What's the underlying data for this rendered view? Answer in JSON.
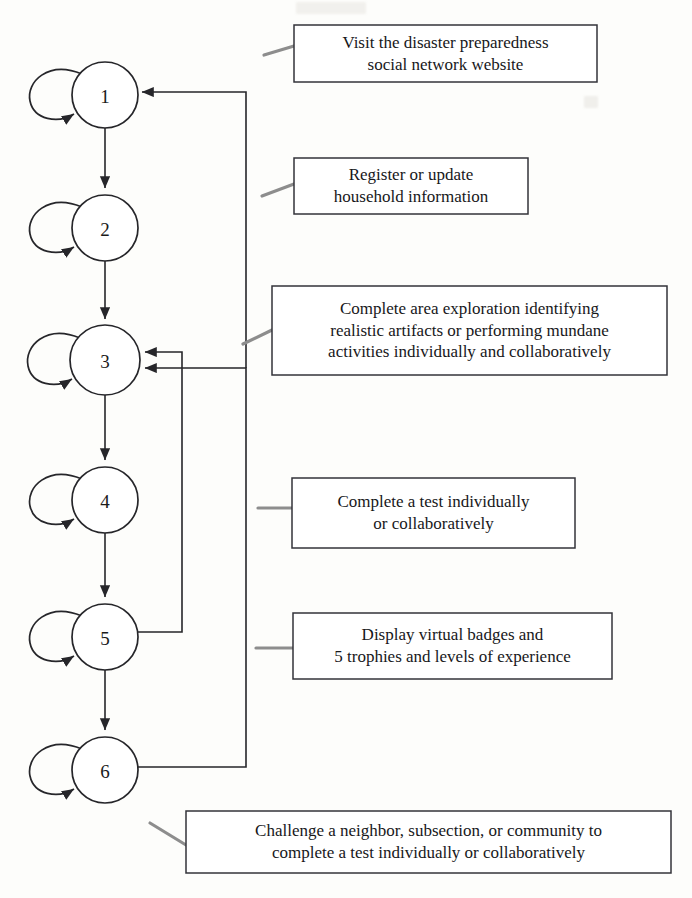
{
  "diagram": {
    "type": "flowchart-state-diagram",
    "background_color": "#fdfdfb",
    "stroke_color": "#26262a",
    "leader_color": "#8d8d8d",
    "nodes": [
      {
        "id": "node-1",
        "label": "1",
        "cx": 105,
        "cy": 95,
        "r": 33
      },
      {
        "id": "node-2",
        "label": "2",
        "cx": 105,
        "cy": 228,
        "r": 33
      },
      {
        "id": "node-3",
        "label": "3",
        "cx": 105,
        "cy": 360,
        "r": 35
      },
      {
        "id": "node-4",
        "label": "4",
        "cx": 105,
        "cy": 500,
        "r": 33
      },
      {
        "id": "node-5",
        "label": "5",
        "cx": 105,
        "cy": 637,
        "r": 33
      },
      {
        "id": "node-6",
        "label": "6",
        "cx": 105,
        "cy": 770,
        "r": 33
      }
    ],
    "callouts": [
      {
        "id": "callout-1",
        "for_node": "1",
        "lines": [
          "Visit the disaster preparedness",
          "social network website"
        ],
        "x": 294,
        "y": 25,
        "w": 303,
        "h": 57,
        "font_size": 17
      },
      {
        "id": "callout-2",
        "for_node": "2",
        "lines": [
          "Register or update",
          "household information"
        ],
        "x": 294,
        "y": 158,
        "w": 234,
        "h": 56,
        "font_size": 17
      },
      {
        "id": "callout-3",
        "for_node": "3",
        "lines": [
          "Complete area exploration identifying",
          "realistic artifacts or performing mundane",
          "activities individually and collaboratively"
        ],
        "x": 272,
        "y": 286,
        "w": 395,
        "h": 89,
        "font_size": 17
      },
      {
        "id": "callout-4",
        "for_node": "4",
        "lines": [
          "Complete a test individually",
          "or collaboratively"
        ],
        "x": 292,
        "y": 478,
        "w": 283,
        "h": 70,
        "font_size": 17
      },
      {
        "id": "callout-5",
        "for_node": "5",
        "lines": [
          "Display virtual badges and",
          "5 trophies and levels of experience"
        ],
        "x": 293,
        "y": 613,
        "w": 319,
        "h": 66,
        "font_size": 17
      },
      {
        "id": "callout-6",
        "for_node": "6",
        "lines": [
          "Challenge a neighbor, subsection, or community to",
          "complete a test individually or collaboratively"
        ],
        "x": 186,
        "y": 811,
        "w": 485,
        "h": 62,
        "font_size": 17
      }
    ],
    "edges": [
      {
        "id": "edge-1-2",
        "from": "1",
        "to": "2",
        "kind": "vertical-arrow"
      },
      {
        "id": "edge-2-3",
        "from": "2",
        "to": "3",
        "kind": "vertical-arrow"
      },
      {
        "id": "edge-3-4",
        "from": "3",
        "to": "4",
        "kind": "vertical-arrow"
      },
      {
        "id": "edge-4-5",
        "from": "4",
        "to": "5",
        "kind": "vertical-arrow"
      },
      {
        "id": "edge-5-6",
        "from": "5",
        "to": "6",
        "kind": "vertical-arrow"
      },
      {
        "id": "edge-5-3",
        "from": "5",
        "to": "3",
        "kind": "feedback-right-loop"
      },
      {
        "id": "edge-6-3",
        "from": "6",
        "to": "3",
        "kind": "feedback-right-loop"
      },
      {
        "id": "edge-6-1",
        "from": "6",
        "to": "1",
        "kind": "feedback-right-loop"
      }
    ],
    "self_loops": [
      {
        "id": "selfloop-1",
        "node": "1"
      },
      {
        "id": "selfloop-2",
        "node": "2"
      },
      {
        "id": "selfloop-3",
        "node": "3"
      },
      {
        "id": "selfloop-4",
        "node": "4"
      },
      {
        "id": "selfloop-5",
        "node": "5"
      },
      {
        "id": "selfloop-6",
        "node": "6"
      }
    ]
  }
}
